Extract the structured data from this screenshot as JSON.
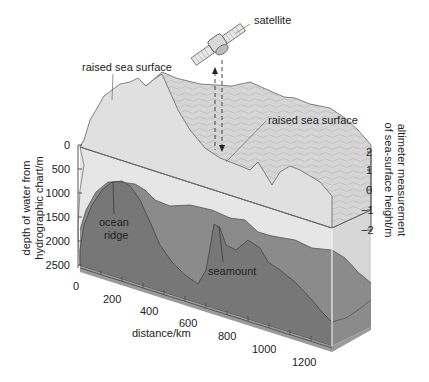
{
  "diagram": {
    "labels": {
      "satellite": "satellite",
      "raised_left": "raised sea surface",
      "raised_right": "raised sea surface",
      "ocean_ridge_1": "ocean",
      "ocean_ridge_2": "ridge",
      "seamount": "seamount"
    },
    "left_axis": {
      "label_line1": "depth of water from",
      "label_line2": "hydrographic chart/m",
      "ticks": [
        "0",
        "500",
        "1000",
        "1500",
        "2000",
        "2500"
      ]
    },
    "right_axis": {
      "label_line1": "altimeter measurement",
      "label_line2": "of sea-surface height/m",
      "ticks": [
        "2",
        "1",
        "0",
        "−1",
        "−2"
      ]
    },
    "bottom_axis": {
      "label": "distance/km",
      "ticks": [
        "0",
        "200",
        "400",
        "600",
        "800",
        "1000",
        "1200"
      ]
    },
    "colors": {
      "water": "#e2e2e2",
      "sea_surface": "#d4d4d4",
      "sea_floor": "#8a8a8a",
      "sea_floor_front": "#7b7b7b",
      "box_side": "#a6a6a6",
      "line": "#555555"
    }
  }
}
